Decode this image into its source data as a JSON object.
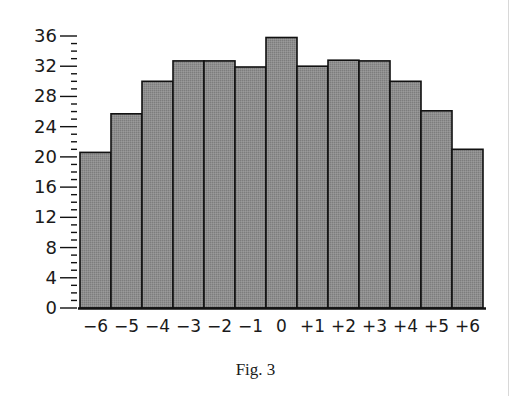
{
  "caption": "Fig. 3",
  "colors": {
    "bar_fill": "#8c8c8c",
    "bar_stroke": "#111111",
    "axis": "#111111",
    "text": "#1a1a1a"
  },
  "chart_data": {
    "type": "bar",
    "title": "",
    "xlabel": "",
    "ylabel": "",
    "categories": [
      "−6",
      "−5",
      "−4",
      "−3",
      "−2",
      "−1",
      "0",
      "+1",
      "+2",
      "+3",
      "+4",
      "+5",
      "+6"
    ],
    "values": [
      20.6,
      25.7,
      30,
      32.7,
      32.7,
      31.9,
      35.8,
      32,
      32.8,
      32.7,
      30,
      26.1,
      21
    ],
    "yticks": [
      0,
      4,
      8,
      12,
      16,
      20,
      24,
      28,
      32,
      36
    ],
    "yminor_step": 1,
    "ylim": [
      0,
      36
    ],
    "grid": false,
    "legend": null,
    "bar_gap": 0
  }
}
